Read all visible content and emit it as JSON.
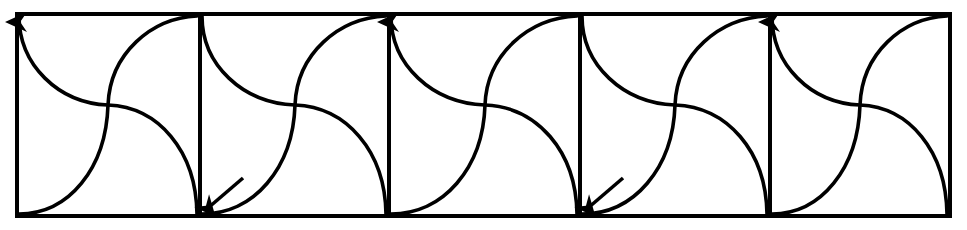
{
  "figure": {
    "type": "diagram",
    "canvas": {
      "width": 967,
      "height": 230
    },
    "style": {
      "background_color": "#ffffff",
      "stroke_color": "#000000",
      "frame_stroke_width": 4,
      "divider_stroke_width": 4,
      "curve_stroke_width": 3.6,
      "arrow_color": "#000000"
    },
    "frame": {
      "left": 17,
      "top": 14,
      "right": 950,
      "bottom": 216,
      "label": "outer-rectangle"
    },
    "grid": {
      "cell_count": 5,
      "divider_x_positions": [
        200,
        389,
        580,
        770
      ],
      "cell_boundaries_x": [
        17,
        200,
        389,
        580,
        770,
        950
      ],
      "cell_top": 14,
      "cell_bottom": 216
    },
    "cells": [
      {
        "index": 1,
        "x_left": 17,
        "x_right": 200,
        "curve_a": "descending S from top-left corner to center then out to bottom-right",
        "curve_b": "ascending S from bottom-left corner to center then up to top-right",
        "crossing_point": {
          "x": 108,
          "y": 105
        }
      },
      {
        "index": 2,
        "x_left": 200,
        "x_right": 389,
        "curve_a": "descending S from top-left corner to center then out to bottom-right",
        "curve_b": "ascending S from bottom-left corner to center then up to top-right",
        "crossing_point": {
          "x": 295,
          "y": 105
        }
      },
      {
        "index": 3,
        "x_left": 389,
        "x_right": 580,
        "curve_a": "descending S from top-left corner to center then out to bottom-right",
        "curve_b": "ascending S from bottom-left corner to center then up to top-right",
        "crossing_point": {
          "x": 485,
          "y": 105
        }
      },
      {
        "index": 4,
        "x_left": 580,
        "x_right": 770,
        "curve_a": "descending S from top-left corner to center then out to bottom-right",
        "curve_b": "ascending S from bottom-left corner to center then up to top-right",
        "crossing_point": {
          "x": 675,
          "y": 105
        }
      },
      {
        "index": 5,
        "x_left": 770,
        "x_right": 950,
        "curve_a": "descending S from top-left corner to center then out to bottom-right",
        "curve_b": "ascending S from bottom-left corner to center then up to top-right",
        "crossing_point": {
          "x": 860,
          "y": 105
        }
      }
    ],
    "arrows": [
      {
        "name": "up-arrow-left-edge",
        "direction": "up",
        "tip": {
          "x": 17,
          "y": 14
        },
        "on": "left frame edge"
      },
      {
        "name": "up-arrow-divider-2",
        "direction": "up",
        "tip": {
          "x": 389,
          "y": 14
        },
        "on": "divider at x=389"
      },
      {
        "name": "up-arrow-divider-4",
        "direction": "up",
        "tip": {
          "x": 770,
          "y": 14
        },
        "on": "divider at x=770"
      },
      {
        "name": "down-left-arrow-divider-1",
        "direction": "down-left",
        "tip": {
          "x": 200,
          "y": 213
        },
        "on": "curve meeting divider at x=200 bottom"
      },
      {
        "name": "down-left-arrow-divider-3",
        "direction": "down-left",
        "tip": {
          "x": 580,
          "y": 213
        },
        "on": "curve meeting divider at x=580 bottom"
      }
    ]
  }
}
